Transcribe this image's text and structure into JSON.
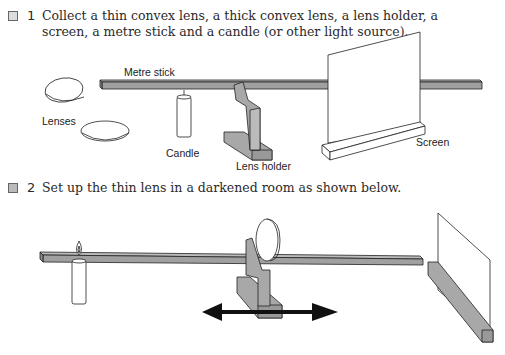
{
  "steps": [
    {
      "number": "1",
      "icon": "checkbox-icon",
      "text": "Collect a thin convex lens, a thick convex lens, a lens holder, a screen, a metre stick and a candle (or other light source)."
    },
    {
      "number": "2",
      "icon": "picture-icon",
      "text": "Set up the thin lens in a darkened room as shown below."
    }
  ],
  "figure1": {
    "labels": {
      "metre_stick": "Metre stick",
      "lenses": "Lenses",
      "candle": "Candle",
      "lens_holder": "Lens holder",
      "screen": "Screen"
    }
  },
  "colors": {
    "equipment_grey": "#a8a8a8",
    "outline": "#222222",
    "arrow": "#111111"
  }
}
